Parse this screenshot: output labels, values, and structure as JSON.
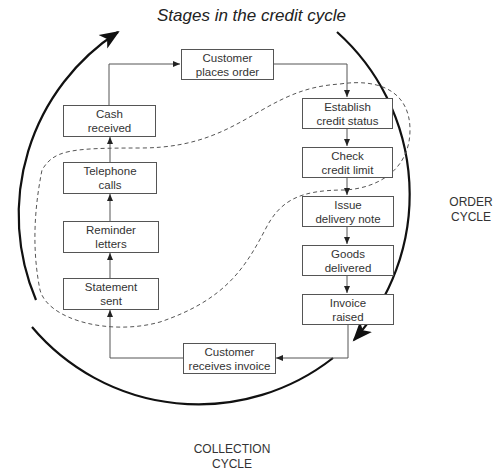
{
  "title": "Stages in the credit cycle",
  "cycles": {
    "order": {
      "line1": "ORDER",
      "line2": "CYCLE"
    },
    "collection": {
      "line1": "COLLECTION",
      "line2": "CYCLE"
    }
  },
  "stages": {
    "customer_places_order": {
      "line1": "Customer",
      "line2": "places order"
    },
    "establish_credit_status": {
      "line1": "Establish",
      "line2": "credit status"
    },
    "check_credit_limit": {
      "line1": "Check",
      "line2": "credit limit"
    },
    "issue_delivery_note": {
      "line1": "Issue",
      "line2": "delivery note"
    },
    "goods_delivered": {
      "line1": "Goods",
      "line2": "delivered"
    },
    "invoice_raised": {
      "line1": "Invoice",
      "line2": "raised"
    },
    "customer_receives_invoice": {
      "line1": "Customer",
      "line2": "receives invoice"
    },
    "statement_sent": {
      "line1": "Statement",
      "line2": "sent"
    },
    "reminder_letters": {
      "line1": "Reminder",
      "line2": "letters"
    },
    "telephone_calls": {
      "line1": "Telephone",
      "line2": "calls"
    },
    "cash_received": {
      "line1": "Cash",
      "line2": "received"
    }
  },
  "flow_order": [
    "Customer places order",
    "Establish credit status",
    "Check credit limit",
    "Issue delivery note",
    "Goods delivered",
    "Invoice raised",
    "Customer receives invoice",
    "Statement sent",
    "Reminder letters",
    "Telephone calls",
    "Cash received"
  ],
  "colors": {
    "line": "#555555",
    "cycle_arc": "#111111",
    "text": "#333333"
  }
}
